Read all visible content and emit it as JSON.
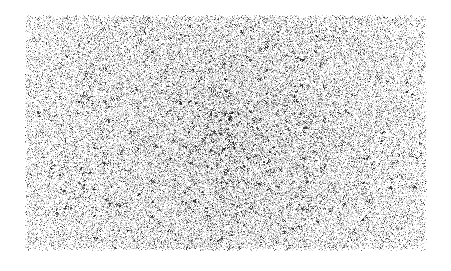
{
  "image": {
    "title": "Grain Noise Texture",
    "kind": "noise-texture",
    "width": 451,
    "height": 271,
    "background_color": "#ffffff"
  },
  "texture": {
    "region": {
      "x": 24,
      "y": 14,
      "width": 404,
      "height": 238
    },
    "grain": {
      "dot_size": 1,
      "base_density": 0.3,
      "center_density": 0.62,
      "edge_density": 0.2,
      "ink_color": "#3a3a3a",
      "light_ink_color": "#9a9a9a",
      "dark_ink_color": "#1a1a1a",
      "cluster_count": 420,
      "cluster_max_radius": 2.6,
      "seed": 20240617
    },
    "gradient": {
      "type": "radial",
      "center_x_ratio": 0.5,
      "center_y_ratio": 0.52,
      "falloff_power": 1.35,
      "vignette_strength": 0.72
    },
    "edge_fade": {
      "top": 3,
      "right": 4,
      "bottom": 4,
      "left": 3
    }
  }
}
